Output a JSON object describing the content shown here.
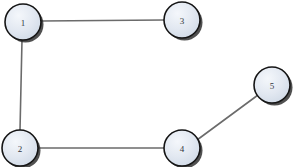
{
  "diagram": {
    "background_color": "#ffffff",
    "node_fill_color": "#dde4ee",
    "node_fill_highlight": "#f2f6fb",
    "node_border_color": "#151515",
    "node_label_color": "#33373d",
    "edge_color": "#6b6b6b",
    "node_radius": 18,
    "nodes": [
      {
        "id": "1",
        "label": "1",
        "cx": 23,
        "cy": 22
      },
      {
        "id": "2",
        "label": "2",
        "cx": 20,
        "cy": 148
      },
      {
        "id": "3",
        "label": "3",
        "cx": 182,
        "cy": 20
      },
      {
        "id": "4",
        "label": "4",
        "cx": 182,
        "cy": 148
      },
      {
        "id": "5",
        "label": "5",
        "cx": 272,
        "cy": 85
      }
    ],
    "edges": [
      {
        "id": "1-3",
        "from": "1",
        "to": "3",
        "x1": 41,
        "y1": 21,
        "x2": 164,
        "y2": 20
      },
      {
        "id": "1-2",
        "from": "1",
        "to": "2",
        "x1": 22,
        "y1": 40,
        "x2": 20,
        "y2": 130
      },
      {
        "id": "2-4",
        "from": "2",
        "to": "4",
        "x1": 38,
        "y1": 148,
        "x2": 164,
        "y2": 148
      },
      {
        "id": "4-5",
        "from": "4",
        "to": "5",
        "x1": 197,
        "y1": 140,
        "x2": 258,
        "y2": 95
      }
    ]
  }
}
